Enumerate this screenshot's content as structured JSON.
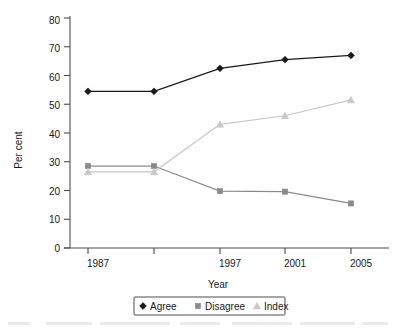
{
  "chart_data": {
    "type": "line",
    "title": "",
    "xlabel": "Year",
    "ylabel": "Per cent",
    "categories": [
      "1987",
      "",
      "1997",
      "2001",
      "2005"
    ],
    "x_tick_labels": [
      "1987",
      "",
      "1997",
      "2001",
      "2005"
    ],
    "y_tick_labels": [
      "0",
      "10",
      "20",
      "30",
      "40",
      "50",
      "60",
      "70",
      "80"
    ],
    "ylim": [
      0,
      80
    ],
    "y_tick_step": 10,
    "grid": false,
    "legend_position": "bottom",
    "series": [
      {
        "name": "Agree",
        "marker": "diamond",
        "color": "#1a1a1a",
        "values": [
          54.5,
          54.5,
          62.5,
          65.5,
          67.0
        ]
      },
      {
        "name": "Disagree",
        "marker": "square",
        "color": "#8a8a8a",
        "values": [
          28.5,
          28.5,
          19.8,
          19.6,
          15.5
        ]
      },
      {
        "name": "Index",
        "marker": "triangle",
        "color": "#c8c8c8",
        "values": [
          26.5,
          26.5,
          43.0,
          46.0,
          51.5
        ]
      }
    ]
  },
  "axes": {
    "y_title": "Per cent",
    "x_title": "Year"
  },
  "legend": {
    "items": [
      {
        "label": "Agree",
        "marker": "diamond-marker",
        "color": "#1a1a1a"
      },
      {
        "label": "Disagree",
        "marker": "square-marker",
        "color": "#8a8a8a"
      },
      {
        "label": "Index",
        "marker": "triangle-marker",
        "color": "#c8c8c8"
      }
    ]
  }
}
